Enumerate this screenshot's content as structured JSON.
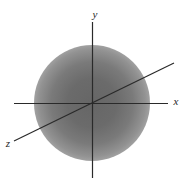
{
  "diagram": {
    "type": "3d-coordinate-system-with-spherical-cloud",
    "labels": {
      "x_axis": "x",
      "y_axis": "y",
      "z_axis": "z"
    },
    "colors": {
      "background": "#ffffff",
      "axis_line": "#2a2a2a",
      "cloud_center": "#666666",
      "cloud_edge": "#ffffff",
      "label_text": "#1f1f1f"
    },
    "geometry": {
      "origin": {
        "x": 92,
        "y": 103
      },
      "cloud_radius_px": 58
    }
  }
}
